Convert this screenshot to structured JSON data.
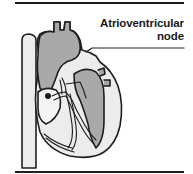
{
  "figure": {
    "label": {
      "line1": "Atrioventricular",
      "line2": "node"
    },
    "colors": {
      "outline": "#1e1e1e",
      "chamber_fill_dark": "#a9a9a9",
      "chamber_fill_light": "#ececec",
      "background": "#ffffff"
    }
  }
}
